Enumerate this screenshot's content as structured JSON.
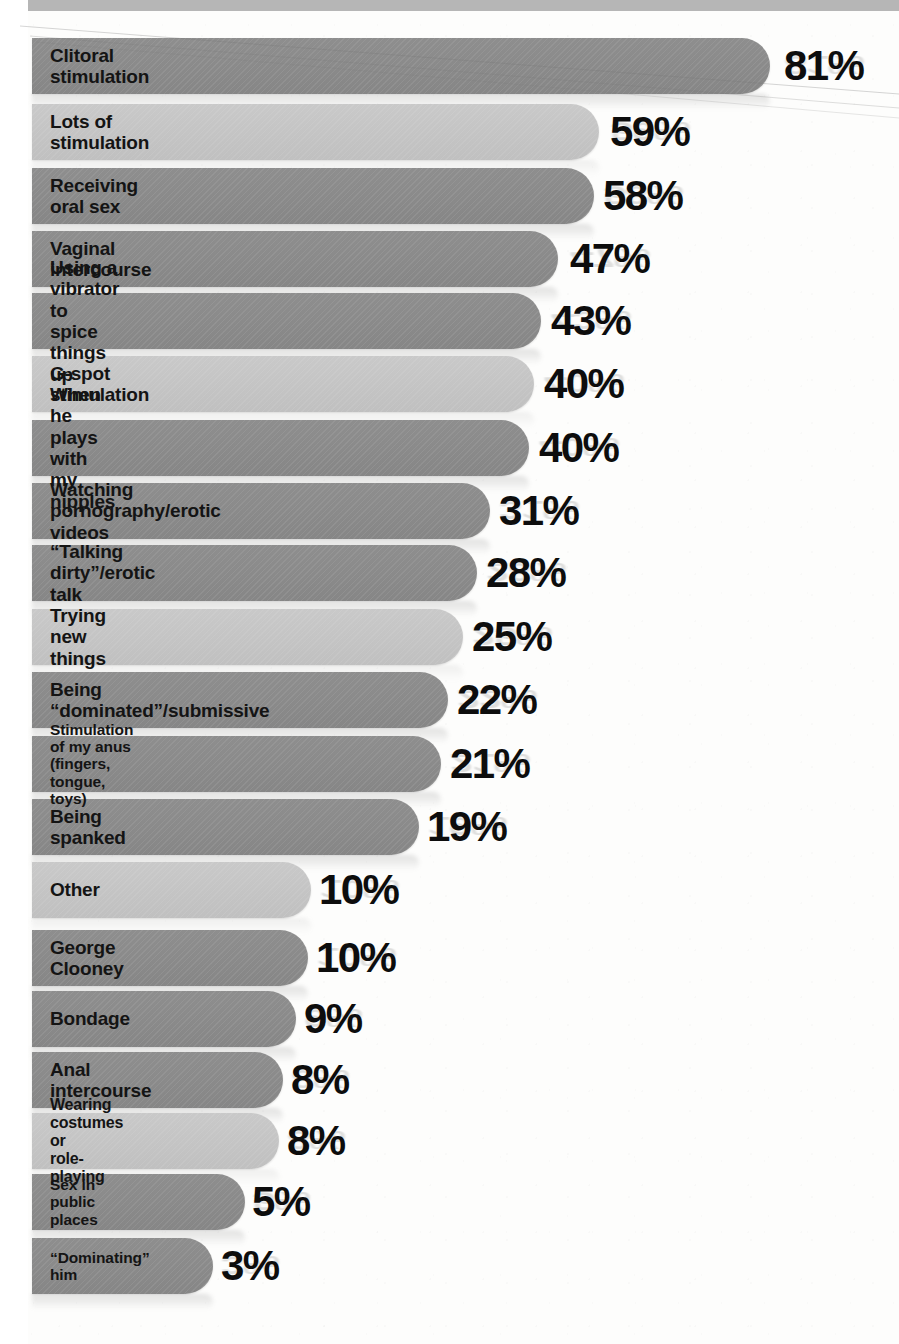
{
  "chart_data": {
    "type": "bar",
    "title": "",
    "subtitle": "",
    "xlabel": "",
    "ylabel": "",
    "orientation": "horizontal",
    "grid": false,
    "legend": null,
    "value_suffix": "%",
    "xlim": [
      0,
      100
    ],
    "categories": [
      "Clitoral stimulation",
      "Lots of stimulation",
      "Receiving oral sex",
      "Vaginal intercourse",
      "Using a vibrator to spice things up",
      "G-spot stimulation",
      "When he plays with my nipples",
      "Watching pornography/erotic videos",
      "“Talking dirty”/erotic talk",
      "Trying new things",
      "Being “dominated”/submissive",
      "Stimulation of my anus (fingers, tongue, toys)",
      "Being spanked",
      "Other",
      "George Clooney",
      "Bondage",
      "Anal intercourse",
      "Wearing costumes or\nrole-playing",
      "Sex in public places",
      "“Dominating” him"
    ],
    "values": [
      81,
      59,
      58,
      47,
      43,
      40,
      40,
      31,
      28,
      25,
      22,
      21,
      19,
      10,
      10,
      9,
      8,
      8,
      5,
      3
    ],
    "value_labels": [
      "81%",
      "59%",
      "58%",
      "47%",
      "43%",
      "40%",
      "40%",
      "31%",
      "28%",
      "25%",
      "22%",
      "21%",
      "19%",
      "10%",
      "10%",
      "9%",
      "8%",
      "8%",
      "5%",
      "3%"
    ]
  },
  "style": {
    "bar_dark": "#8a8a8a",
    "bar_light": "#c4c4c4",
    "value_color": "#0d0d0d",
    "label_color": "#141414",
    "background": "#fdfdfc"
  },
  "rows": [
    {
      "label": "Clitoral stimulation",
      "value": "81%",
      "pct": 81,
      "shade": "dark",
      "bar_end": 770,
      "value_x": 784,
      "top": 38,
      "size": "normal"
    },
    {
      "label": "Lots of stimulation",
      "value": "59%",
      "pct": 59,
      "shade": "light",
      "bar_end": 599,
      "value_x": 610,
      "top": 104,
      "size": "normal"
    },
    {
      "label": "Receiving oral sex",
      "value": "58%",
      "pct": 58,
      "shade": "dark",
      "bar_end": 594,
      "value_x": 603,
      "top": 168,
      "size": "normal"
    },
    {
      "label": "Vaginal intercourse",
      "value": "47%",
      "pct": 47,
      "shade": "dark",
      "bar_end": 558,
      "value_x": 570,
      "top": 231,
      "size": "normal"
    },
    {
      "label": "Using a vibrator to spice things up",
      "value": "43%",
      "pct": 43,
      "shade": "dark",
      "bar_end": 541,
      "value_x": 551,
      "top": 293,
      "size": "normal"
    },
    {
      "label": "G-spot stimulation",
      "value": "40%",
      "pct": 40,
      "shade": "light",
      "bar_end": 534,
      "value_x": 544,
      "top": 356,
      "size": "normal"
    },
    {
      "label": "When he plays with my nipples",
      "value": "40%",
      "pct": 40,
      "shade": "dark",
      "bar_end": 529,
      "value_x": 539,
      "top": 420,
      "size": "normal"
    },
    {
      "label": "Watching pornography/erotic videos",
      "value": "31%",
      "pct": 31,
      "shade": "dark",
      "bar_end": 490,
      "value_x": 499,
      "top": 483,
      "size": "normal"
    },
    {
      "label": "“Talking dirty”/erotic talk",
      "value": "28%",
      "pct": 28,
      "shade": "dark",
      "bar_end": 477,
      "value_x": 486,
      "top": 545,
      "size": "normal"
    },
    {
      "label": "Trying new things",
      "value": "25%",
      "pct": 25,
      "shade": "light",
      "bar_end": 463,
      "value_x": 472,
      "top": 609,
      "size": "normal"
    },
    {
      "label": "Being “dominated”/submissive",
      "value": "22%",
      "pct": 22,
      "shade": "dark",
      "bar_end": 448,
      "value_x": 457,
      "top": 672,
      "size": "normal"
    },
    {
      "label": "Stimulation of my anus (fingers, tongue, toys)",
      "value": "21%",
      "pct": 21,
      "shade": "dark",
      "bar_end": 441,
      "value_x": 450,
      "top": 736,
      "size": "small"
    },
    {
      "label": "Being spanked",
      "value": "19%",
      "pct": 19,
      "shade": "dark",
      "bar_end": 419,
      "value_x": 427,
      "top": 799,
      "size": "normal"
    },
    {
      "label": "Other",
      "value": "10%",
      "pct": 10,
      "shade": "light",
      "bar_end": 311,
      "value_x": 319,
      "top": 862,
      "size": "normal"
    },
    {
      "label": "George Clooney",
      "value": "10%",
      "pct": 10,
      "shade": "dark",
      "bar_end": 308,
      "value_x": 316,
      "top": 930,
      "size": "normal"
    },
    {
      "label": "Bondage",
      "value": "9%",
      "pct": 9,
      "shade": "dark",
      "bar_end": 296,
      "value_x": 304,
      "top": 991,
      "size": "normal"
    },
    {
      "label": "Anal intercourse",
      "value": "8%",
      "pct": 8,
      "shade": "dark",
      "bar_end": 283,
      "value_x": 291,
      "top": 1052,
      "size": "normal"
    },
    {
      "label": "Wearing costumes or\nrole-playing",
      "value": "8%",
      "pct": 8,
      "shade": "light",
      "bar_end": 279,
      "value_x": 287,
      "top": 1113,
      "size": "two"
    },
    {
      "label": "Sex in public places",
      "value": "5%",
      "pct": 5,
      "shade": "dark",
      "bar_end": 245,
      "value_x": 252,
      "top": 1174,
      "size": "small"
    },
    {
      "label": "“Dominating” him",
      "value": "3%",
      "pct": 3,
      "shade": "dark",
      "bar_end": 213,
      "value_x": 221,
      "top": 1238,
      "size": "small"
    }
  ]
}
